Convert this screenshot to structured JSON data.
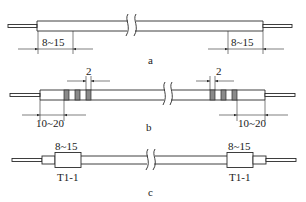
{
  "colors": {
    "stroke": "#2a2a2a",
    "band_fill": "#8a8a8a",
    "background": "#ffffff"
  },
  "diagrams": [
    {
      "id": "a",
      "caption": "a",
      "dimensions": [
        {
          "side": "left",
          "label": "8~15"
        },
        {
          "side": "right",
          "label": "8~15"
        }
      ]
    },
    {
      "id": "b",
      "caption": "b",
      "band_spacing_label_left": "2",
      "band_spacing_label_right": "2",
      "bands_per_end": 3,
      "dimensions": [
        {
          "side": "left",
          "label": "10~20"
        },
        {
          "side": "right",
          "label": "10~20"
        }
      ]
    },
    {
      "id": "c",
      "caption": "c",
      "sleeves": [
        {
          "side": "left",
          "length_label": "8~15",
          "marking": "T1-1"
        },
        {
          "side": "right",
          "length_label": "8~15",
          "marking": "T1-1"
        }
      ]
    }
  ]
}
